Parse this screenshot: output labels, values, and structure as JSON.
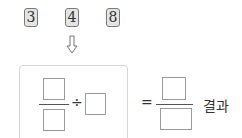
{
  "number_tiles": [
    {
      "value": "3"
    },
    {
      "value": "4"
    },
    {
      "value": "8"
    }
  ],
  "arrow": {
    "icon": "down-arrow-icon"
  },
  "expression": {
    "operator": "÷",
    "equals": "=",
    "result_label": "결과"
  },
  "colors": {
    "tile_bg": "#e4e4e4",
    "tile_border": "#7a7a7a",
    "panel_border": "#d6d6d6",
    "blank_border": "#9a9a9a"
  }
}
